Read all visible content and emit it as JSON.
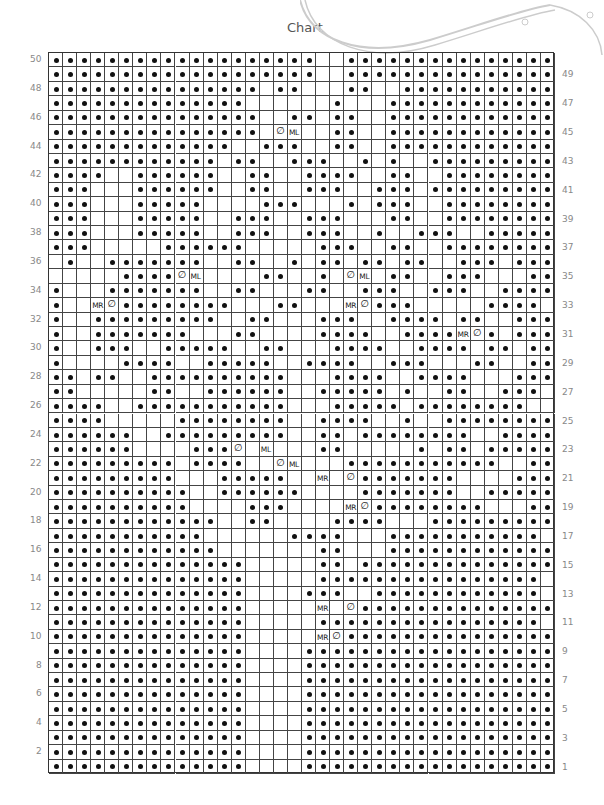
{
  "title": "Chart",
  "chart_data": {
    "type": "table",
    "title": "Chart",
    "cols": 36,
    "rows": 50,
    "legend_symbols": {
      ".": "purl dot",
      " ": "blank/knit",
      "T": "twist stitch (slashed dot)",
      "R": "MR (make right)",
      "L": "ML (make left)"
    },
    "row_labels_left": [
      50,
      48,
      46,
      44,
      42,
      40,
      38,
      36,
      34,
      32,
      30,
      28,
      26,
      24,
      22,
      20,
      18,
      16,
      14,
      12,
      10,
      8,
      6,
      4,
      2
    ],
    "row_labels_right": [
      49,
      47,
      45,
      43,
      41,
      39,
      37,
      35,
      33,
      31,
      29,
      27,
      25,
      23,
      21,
      19,
      17,
      15,
      13,
      11,
      9,
      7,
      5,
      3,
      1
    ],
    "grid_top_to_bottom": [
      "...................  ................",
      "...................  ................",
      "............... ..   ..  ...........",
      "..............      .   ............",
      "...............  .. ..  ............",
      "............... TL  ..  ............",
      ".............  ...  ..  ............",
      "............ ..  ...  . .  .........",
      "....  ......  ..  ....  ..  ........",
      "...   ......  ..  ...  ... .........",
      "...   .....    ...   . ...  ........",
      "...   .....  ...  ...   ..  ........",
      "...   .....  ...  ...  .  ...  .....",
      "...     ......     ...  ..  ........",
      " .  .......  ..  . .. .. ..  ... ...",
      "     ....TL    ..  . TL ..  ...   ..",
      ".   .......  ..   ..  ...  ...  ....",
      ".  RT........   ..   RT...     ....  ",
      ".  .........  ..   ...  .... ..  ...",
      ".  .......   ..    ....  ....RT. ...",
      ".  ...  .....  ..   ....  .... .. ..",
      ".    ....  .....  ....  ...   ..  ..",
      ".. ..  ..........   ....  ....   ...",
      "..     ..  ......  ..... .  ..  ...",
      "....  ...........   ..... ........  ",
      "....     ........  ....  .  ........",
      "......  .........  .. ........  ....",
      "......    ...T L   ..     . .. .....",
      "......... ....  TL   ...........  ..",
      ".........   .....  R T.......    ...",
      "..........  ......    .......  .....",
      "..........    ...    RT........   ..",
      "............  ..    ....   .........",
      "...........      ....   ...........",
      "............       ..   ............",
      "..............     .. ..............",
      "..............     ................",
      "..............    ...  ............",
      "..............     R T..............",
      "..............     ................",
      "..............     RT...............",
      "..............    ..................",
      "..............    ..................",
      "..............    ..................",
      "..............    ..................",
      "..............    ..................",
      "..............    ..................",
      "..............    ..................",
      "..............    ..................",
      "..............    .................."
    ]
  },
  "labels": {
    "mr": "MR",
    "ml": "ML"
  }
}
